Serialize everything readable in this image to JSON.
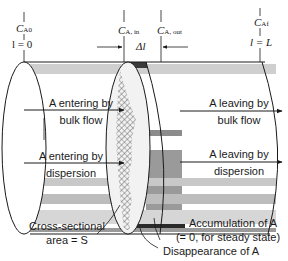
{
  "positions": {
    "inlet": {
      "conc_symbol": "C",
      "conc_sub": "A0",
      "pos_label": "l = 0"
    },
    "section_in": {
      "conc_symbol": "C",
      "conc_sub": "A, in"
    },
    "section_out": {
      "conc_symbol": "C",
      "conc_sub": "A, out"
    },
    "section_length": "Δl",
    "outlet": {
      "conc_symbol": "C",
      "conc_sub": "Af",
      "pos_label": "l = L"
    }
  },
  "flows": {
    "enter_bulk": {
      "line1": "A entering by",
      "line2": "bulk flow"
    },
    "enter_disp": {
      "line1": "A entering by",
      "line2": "dispersion"
    },
    "leave_bulk": {
      "line1": "A leaving by",
      "line2": "bulk flow"
    },
    "leave_disp": {
      "line1": "A leaving by",
      "line2": "dispersion"
    }
  },
  "annotations": {
    "cross_section": {
      "line1": "Cross-sectional",
      "line2": "area = S"
    },
    "accumulation": {
      "line1": "Accumulation of A",
      "line2": "(= 0, for steady state)"
    },
    "disappearance": "Disappearance of A"
  },
  "colors": {
    "stroke": "#1a1a1a",
    "stripe_dark": "#8c8c8c",
    "stripe_mid": "#b5b5b5",
    "stripe_light": "#d4d4d4",
    "hatch": "#555555"
  }
}
